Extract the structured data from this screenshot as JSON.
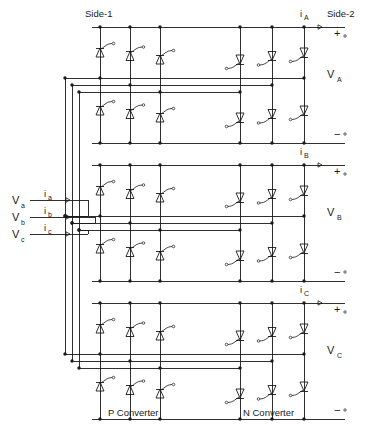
{
  "diagram": {
    "title_side1": "Side-1",
    "title_side2": "Side-2",
    "converter_p_label": "P Converter",
    "converter_n_label": "N Converter",
    "stroke_color": "#1a1a1a",
    "background": "#ffffff"
  },
  "inputs": {
    "voltages": [
      {
        "symbol": "V",
        "sub": "a"
      },
      {
        "symbol": "V",
        "sub": "b"
      },
      {
        "symbol": "V",
        "sub": "c"
      }
    ],
    "currents": [
      {
        "symbol": "i",
        "sub": "a"
      },
      {
        "symbol": "i",
        "sub": "b"
      },
      {
        "symbol": "i",
        "sub": "c"
      }
    ]
  },
  "outputs": {
    "phases": [
      {
        "current": {
          "symbol": "i",
          "sub": "A"
        },
        "voltage": {
          "symbol": "V",
          "sub": "A"
        },
        "plus": "+",
        "minus": "−"
      },
      {
        "current": {
          "symbol": "i",
          "sub": "B"
        },
        "voltage": {
          "symbol": "V",
          "sub": "B"
        },
        "plus": "+",
        "minus": "−"
      },
      {
        "current": {
          "symbol": "i",
          "sub": "C"
        },
        "voltage": {
          "symbol": "V",
          "sub": "C"
        },
        "plus": "+",
        "minus": "−"
      }
    ]
  },
  "structure": {
    "phase_module_count": 3,
    "columns_per_converter": 3,
    "thyristors_per_module": 12,
    "p_converter_orientation": "up",
    "n_converter_orientation": "down"
  }
}
